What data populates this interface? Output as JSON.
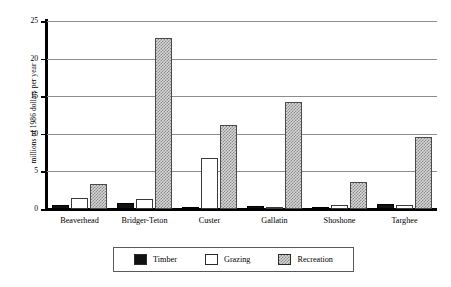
{
  "chart_data": {
    "type": "bar",
    "title": "",
    "subtitle": "",
    "xlabel": "",
    "ylabel": "millions of 1986 dollars per year",
    "ylim": [
      0,
      25
    ],
    "yticks": [
      0,
      5,
      10,
      15,
      20,
      25
    ],
    "ytick_labels": [
      "0",
      "5",
      "10",
      "15",
      "20",
      "25"
    ],
    "grid": true,
    "grid_axis": "y",
    "legend_position": "bottom",
    "orientation": "vertical",
    "grouping": "grouped",
    "categories": [
      "Beaverhead",
      "Bridger-Teton",
      "Custer",
      "Gallatin",
      "Shoshone",
      "Targhee"
    ],
    "series": [
      {
        "name": "Timber",
        "color": "#111111",
        "pattern": "solid-black",
        "values": [
          0.6,
          0.8,
          0.2,
          0.35,
          0.3,
          0.7
        ]
      },
      {
        "name": "Grazing",
        "color": "#ffffff",
        "pattern": "solid-white",
        "values": [
          1.4,
          1.3,
          6.8,
          0.1,
          0.6,
          0.5
        ]
      },
      {
        "name": "Recreation",
        "color": "#d7d7d7",
        "pattern": "dotted-gray",
        "values": [
          3.3,
          22.8,
          11.2,
          14.2,
          3.6,
          9.6
        ]
      }
    ]
  },
  "legend": {
    "items": [
      {
        "label": "Timber"
      },
      {
        "label": "Grazing"
      },
      {
        "label": "Recreation"
      }
    ]
  }
}
